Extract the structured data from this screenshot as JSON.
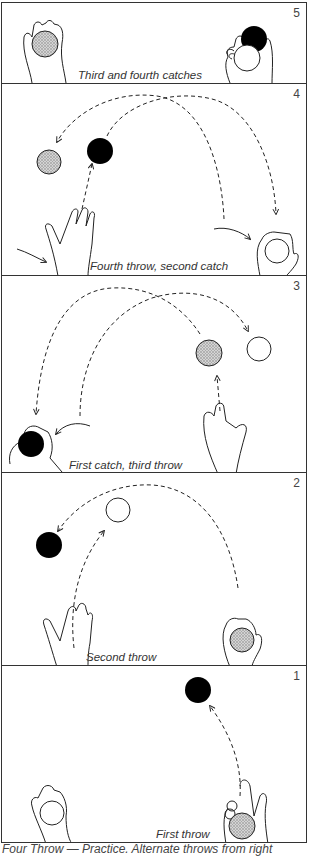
{
  "figure": {
    "footer_caption": "Four Throw — Practice. Alternate throws from right",
    "colors": {
      "outline": "#222222",
      "stipple_ball": "#b8b8b8",
      "black_ball": "#000000",
      "white_ball": "#ffffff"
    }
  },
  "panels": [
    {
      "number": "5",
      "caption": "Third and fourth catches"
    },
    {
      "number": "4",
      "caption": "Fourth throw, second catch"
    },
    {
      "number": "3",
      "caption": "First catch,    third throw"
    },
    {
      "number": "2",
      "caption": "Second throw"
    },
    {
      "number": "1",
      "caption": "First throw"
    }
  ]
}
